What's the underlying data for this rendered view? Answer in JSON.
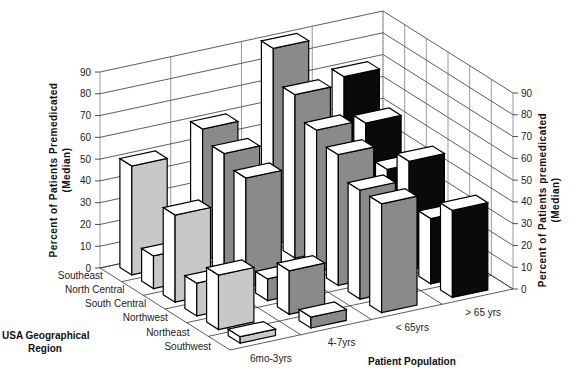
{
  "chart_data": {
    "type": "bar3d",
    "title": "",
    "ylabel_left": "Percent of Patients Premedicated",
    "ylabel_left_sub": "(Median)",
    "ylabel_right": "Percent of Patients premedicated",
    "ylabel_right_sub": "(Median)",
    "xlabel": "Patient Population",
    "zlabel": "USA Geographical Region",
    "ylim": [
      0,
      90
    ],
    "yticks": [
      0,
      10,
      20,
      30,
      40,
      50,
      60,
      70,
      80,
      90
    ],
    "categories": [
      "6mo-3yrs",
      "4-7yrs",
      "< 65yrs",
      "> 65 yrs"
    ],
    "regions": [
      "Southeast",
      "North Central",
      "South Central",
      "Northwest",
      "Northeast",
      "Southwest"
    ],
    "grid": true,
    "series": [
      {
        "name": "Southeast",
        "values": [
          50,
          60,
          90,
          70
        ]
      },
      {
        "name": "North Central",
        "values": [
          15,
          55,
          75,
          55
        ]
      },
      {
        "name": "South Central",
        "values": [
          40,
          50,
          65,
          40
        ]
      },
      {
        "name": "Northwest",
        "values": [
          15,
          10,
          60,
          50
        ]
      },
      {
        "name": "Northeast",
        "values": [
          25,
          20,
          50,
          30
        ]
      },
      {
        "name": "Southwest",
        "values": [
          3,
          5,
          50,
          40
        ]
      }
    ],
    "colors": [
      "#c8c8c8",
      "#8a8a8a",
      "#8a8a8a",
      "#0a0a0a"
    ]
  }
}
